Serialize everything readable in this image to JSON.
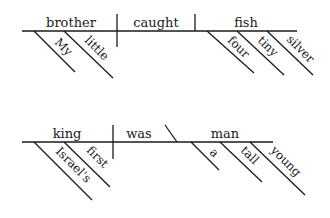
{
  "diagrams": [
    {
      "name": "sentence-1",
      "subject": "brother",
      "verb": "caught",
      "object": "fish",
      "subject_modifiers": [
        "My",
        "little"
      ],
      "object_modifiers": [
        "four",
        "tiny",
        "silver"
      ]
    },
    {
      "name": "sentence-2",
      "subject": "king",
      "verb": "was",
      "complement": "man",
      "subject_modifiers": [
        "Israel's",
        "first"
      ],
      "complement_modifiers": [
        "a",
        "tall",
        "young"
      ]
    }
  ]
}
